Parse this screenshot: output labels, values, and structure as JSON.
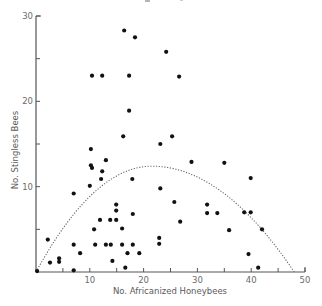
{
  "chart_data": {
    "type": "scatter",
    "title": "",
    "xlabel": "No. Africanized Honeybees",
    "ylabel": "No. Stingless Bees",
    "xlim": [
      0,
      50
    ],
    "ylim": [
      0,
      30
    ],
    "x_ticks": [
      10,
      20,
      30,
      40,
      50
    ],
    "x_minor_ticks": [
      5,
      15,
      25,
      35,
      45
    ],
    "y_ticks": [
      10,
      20,
      30
    ],
    "y_minor_ticks": [
      5,
      15,
      25
    ],
    "grid": false,
    "legend": null,
    "points": [
      [
        0.2,
        0.1
      ],
      [
        2.2,
        3.8
      ],
      [
        2.6,
        1.1
      ],
      [
        4.3,
        1.6
      ],
      [
        4.3,
        1.2
      ],
      [
        7.0,
        9.2
      ],
      [
        7.0,
        3.2
      ],
      [
        7.0,
        0.2
      ],
      [
        8.2,
        2.2
      ],
      [
        10.0,
        10.1
      ],
      [
        10.2,
        14.4
      ],
      [
        10.2,
        12.5
      ],
      [
        10.4,
        12.2
      ],
      [
        10.4,
        23.0
      ],
      [
        10.8,
        5.0
      ],
      [
        11.0,
        3.2
      ],
      [
        11.9,
        6.1
      ],
      [
        12.1,
        10.9
      ],
      [
        12.3,
        11.8
      ],
      [
        12.3,
        23.0
      ],
      [
        13.0,
        13.1
      ],
      [
        13.0,
        3.2
      ],
      [
        13.8,
        6.1
      ],
      [
        13.9,
        3.2
      ],
      [
        14.2,
        1.3
      ],
      [
        14.9,
        7.9
      ],
      [
        14.9,
        7.2
      ],
      [
        14.9,
        6.1
      ],
      [
        16.0,
        5.1
      ],
      [
        16.0,
        3.2
      ],
      [
        16.2,
        15.9
      ],
      [
        16.4,
        28.3
      ],
      [
        16.6,
        0.5
      ],
      [
        17.0,
        2.2
      ],
      [
        17.3,
        23.0
      ],
      [
        17.3,
        18.9
      ],
      [
        17.9,
        10.9
      ],
      [
        18.0,
        6.8
      ],
      [
        18.0,
        3.2
      ],
      [
        18.4,
        27.5
      ],
      [
        19.2,
        2.2
      ],
      [
        22.9,
        4.0
      ],
      [
        22.9,
        3.3
      ],
      [
        23.1,
        15.0
      ],
      [
        23.1,
        9.8
      ],
      [
        24.2,
        25.8
      ],
      [
        25.3,
        15.9
      ],
      [
        25.7,
        8.2
      ],
      [
        26.6,
        22.9
      ],
      [
        26.8,
        5.9
      ],
      [
        28.9,
        12.9
      ],
      [
        31.8,
        7.9
      ],
      [
        31.8,
        6.9
      ],
      [
        33.7,
        6.9
      ],
      [
        35.0,
        12.8
      ],
      [
        35.9,
        4.9
      ],
      [
        38.7,
        7.0
      ],
      [
        39.5,
        2.1
      ],
      [
        39.9,
        7.0
      ],
      [
        39.9,
        11.0
      ],
      [
        41.3,
        0.5
      ],
      [
        42.0,
        5.0
      ]
    ],
    "fit_curve": {
      "style": "dotted",
      "type": "quadratic",
      "x_start": 0,
      "x_end": 48,
      "peak_x": 21.5,
      "peak_y": 12.4
    },
    "colors": {
      "points": "#111111",
      "axis": "#555555",
      "curve": "#666666"
    }
  }
}
